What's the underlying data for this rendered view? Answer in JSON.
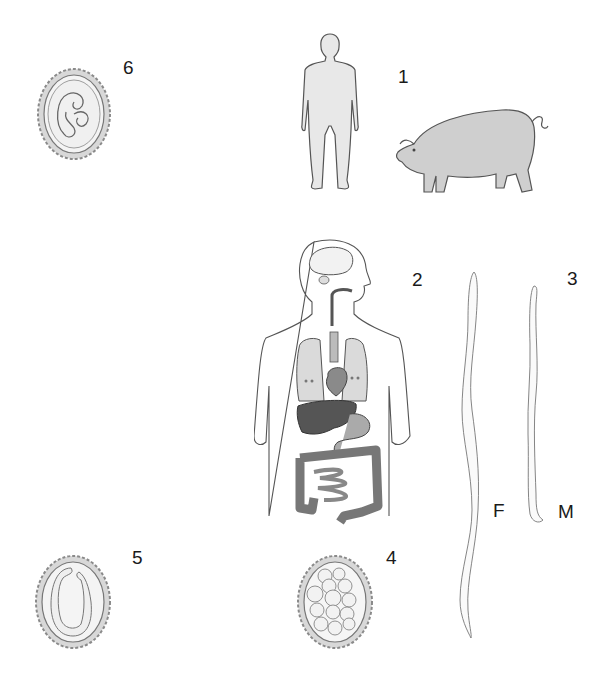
{
  "labels": {
    "l1": "1",
    "l2": "2",
    "l3": "3",
    "l4": "4",
    "l5": "5",
    "l6": "6",
    "female": "F",
    "male": "M"
  },
  "figures": [
    {
      "id": 1,
      "name": "hosts",
      "content": [
        "human-figure",
        "pig-figure"
      ]
    },
    {
      "id": 2,
      "name": "human-anatomy",
      "content": [
        "brain",
        "esophagus",
        "lungs",
        "heart",
        "liver",
        "stomach",
        "intestines"
      ]
    },
    {
      "id": 3,
      "name": "adult-worms",
      "content": [
        "female-worm",
        "male-worm"
      ]
    },
    {
      "id": 4,
      "name": "egg-cleaving",
      "content": [
        "egg-with-blastomeres"
      ]
    },
    {
      "id": 5,
      "name": "egg-larva",
      "content": [
        "egg-with-coiled-larva"
      ]
    },
    {
      "id": 6,
      "name": "egg-embryonated",
      "content": [
        "egg-with-folded-larva"
      ]
    }
  ],
  "colors": {
    "line": "#555555",
    "fill_light": "#e6e6e6",
    "fill_mid": "#bdbdbd",
    "fill_dark": "#5a5a5a",
    "shell": "#9a9a9a"
  }
}
